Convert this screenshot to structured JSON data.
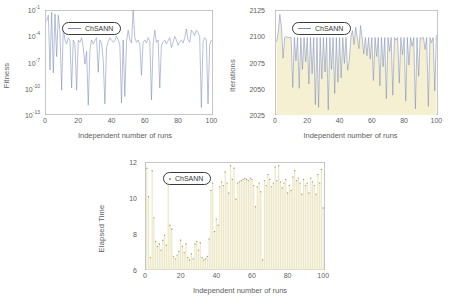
{
  "figure": {
    "series_name": "ChSANN",
    "shared_xlabel": "Independent number of runs",
    "colors": {
      "line": "#7b8cba",
      "fill": "#f5f0d2",
      "stem": "#ece7c4",
      "marker": "#9a9a76",
      "frame": "#b8b8b8",
      "text": "#5e5e5e",
      "legend_border": "#3a3a3a"
    }
  },
  "panels": {
    "fitness": {
      "name": "Fitness vs independent runs",
      "legend_label": "ChSANN",
      "legend_marker": "line-marker",
      "ylabel": "Fitness",
      "xlabel": "Independent number of runs",
      "yticks": [
        "10",
        "10",
        "10",
        "10",
        "10"
      ],
      "ytick_exponents": [
        "-1",
        "-4",
        "-7",
        "-10",
        "-13"
      ],
      "xticks": [
        "0",
        "20",
        "40",
        "60",
        "80",
        "100"
      ]
    },
    "iterations": {
      "name": "Iterations vs independent runs",
      "legend_label": "ChSANN",
      "legend_marker": "line-marker",
      "ylabel": "Iterations",
      "xlabel": "Independent number of runs",
      "yticks": [
        "2125",
        "2100",
        "2075",
        "2050",
        "2025"
      ],
      "xticks": [
        "0",
        "20",
        "40",
        "60",
        "80",
        "100"
      ]
    },
    "elapsed": {
      "name": "Elapsed time vs independent runs",
      "legend_label": "ChSANN",
      "legend_marker": "dot-marker",
      "ylabel": "Elapsed Time",
      "xlabel": "Independent number of runs",
      "yticks": [
        "12",
        "10",
        "8",
        "6"
      ],
      "xticks": [
        "0",
        "20",
        "40",
        "60",
        "80",
        "100"
      ]
    }
  },
  "chart_data": [
    {
      "type": "line",
      "id": "fitness",
      "title": "",
      "xlabel": "Independent number of runs",
      "ylabel": "Fitness",
      "yscale": "log",
      "ylim": [
        1e-14,
        1.0
      ],
      "xlim": [
        0,
        101
      ],
      "grid": false,
      "legend": [
        "ChSANN"
      ],
      "legend_position": "upper-left-inside",
      "series": [
        {
          "name": "ChSANN",
          "x": [
            1,
            2,
            3,
            4,
            5,
            6,
            7,
            8,
            9,
            10,
            11,
            12,
            13,
            14,
            15,
            16,
            17,
            18,
            19,
            20,
            21,
            22,
            23,
            24,
            25,
            26,
            27,
            28,
            29,
            30,
            31,
            32,
            33,
            34,
            35,
            36,
            37,
            38,
            39,
            40,
            41,
            42,
            43,
            44,
            45,
            46,
            47,
            48,
            49,
            50,
            51,
            52,
            53,
            54,
            55,
            56,
            57,
            58,
            59,
            60,
            61,
            62,
            63,
            64,
            65,
            66,
            67,
            68,
            69,
            70,
            71,
            72,
            73,
            74,
            75,
            76,
            77,
            78,
            79,
            80,
            81,
            82,
            83,
            84,
            85,
            86,
            87,
            88,
            89,
            90,
            91,
            92,
            93,
            94,
            95,
            96,
            97,
            98,
            99,
            100
          ],
          "values": [
            0.03,
            0.2,
            1e-08,
            0.5,
            4e-09,
            0.3,
            6e-07,
            0.2,
            0.001,
            2e-11,
            0.005,
            0.0001,
            3e-05,
            0.0002,
            8e-05,
            4e-11,
            0.0001,
            3e-05,
            2e-11,
            0.0001,
            5e-05,
            0.0002,
            1e-05,
            6e-08,
            3e-06,
            2e-13,
            4e-06,
            0.0001,
            3e-05,
            8e-05,
            0.0002,
            5e-09,
            0.0001,
            4e-05,
            2e-07,
            3e-13,
            1e-05,
            6e-05,
            0.0002,
            0.0001,
            5e-05,
            8e-05,
            0.0003,
            0.0001,
            2e-05,
            4e-13,
            0.0001,
            3e-12,
            6e-05,
            0.002,
            0.0001,
            4e-05,
            0.9,
            0.0002,
            5e-05,
            0.0001,
            3e-05,
            2e-09,
            6e-05,
            0.0001,
            4e-05,
            0.0002,
            8e-05,
            1e-12,
            3e-05,
            0.002,
            5e-05,
            0.0001,
            4e-11,
            2e-05,
            6e-05,
            0.0001,
            3e-05,
            8e-05,
            0.0002,
            1e-05,
            5e-05,
            0.0003,
            0.0001,
            2e-05,
            6e-05,
            0.0001,
            4e-05,
            0.0002,
            0.003,
            0.0001,
            5e-05,
            0.002,
            0.001,
            0.0004,
            0.002,
            0.001,
            0.0003,
            1e-13,
            5e-05,
            0.0002,
            0.0001,
            3e-13,
            2e-05,
            0.0001
          ]
        }
      ]
    },
    {
      "type": "area",
      "id": "iterations",
      "title": "",
      "xlabel": "Independent number of runs",
      "ylabel": "Iterations",
      "yscale": "linear",
      "ylim": [
        2010,
        2132
      ],
      "xlim": [
        0,
        101
      ],
      "grid": false,
      "legend": [
        "ChSANN"
      ],
      "legend_position": "upper-left-inside",
      "series": [
        {
          "name": "ChSANN",
          "x": [
            1,
            2,
            3,
            4,
            5,
            6,
            7,
            8,
            9,
            10,
            11,
            12,
            13,
            14,
            15,
            16,
            17,
            18,
            19,
            20,
            21,
            22,
            23,
            24,
            25,
            26,
            27,
            28,
            29,
            30,
            31,
            32,
            33,
            34,
            35,
            36,
            37,
            38,
            39,
            40,
            41,
            42,
            43,
            44,
            45,
            46,
            47,
            48,
            49,
            50,
            51,
            52,
            53,
            54,
            55,
            56,
            57,
            58,
            59,
            60,
            61,
            62,
            63,
            64,
            65,
            66,
            67,
            68,
            69,
            70,
            71,
            72,
            73,
            74,
            75,
            76,
            77,
            78,
            79,
            80,
            81,
            82,
            83,
            84,
            85,
            86,
            87,
            88,
            89,
            90,
            91,
            92,
            93,
            94,
            95,
            96,
            97,
            98,
            99,
            100
          ],
          "values": [
            2095,
            2106,
            2127,
            2112,
            2076,
            2100,
            2101,
            2100,
            2100,
            2100,
            2042,
            2100,
            2073,
            2100,
            2041,
            2100,
            2063,
            2100,
            2072,
            2100,
            2046,
            2100,
            2058,
            2100,
            2022,
            2100,
            2019,
            2100,
            2052,
            2100,
            2060,
            2100,
            2016,
            2100,
            2063,
            2100,
            2035,
            2100,
            2048,
            2100,
            2053,
            2100,
            2070,
            2100,
            2062,
            2073,
            2100,
            2108,
            2092,
            2112,
            2100,
            2087,
            2114,
            2100,
            2081,
            2100,
            2079,
            2100,
            2075,
            2100,
            2050,
            2100,
            2078,
            2100,
            2044,
            2100,
            2066,
            2100,
            2029,
            2100,
            2084,
            2100,
            2033,
            2100,
            2097,
            2100,
            2047,
            2100,
            2080,
            2100,
            2026,
            2100,
            2068,
            2100,
            2090,
            2100,
            2017,
            2100,
            2055,
            2100,
            2099,
            2100,
            2086,
            2100,
            2020,
            2100,
            2094,
            2100,
            2038,
            2103
          ]
        }
      ]
    },
    {
      "type": "bar",
      "id": "elapsed",
      "title": "",
      "xlabel": "Independent number of runs",
      "ylabel": "Elapsed Time",
      "yscale": "linear",
      "ylim": [
        4.2,
        12.9
      ],
      "xlim": [
        0,
        101
      ],
      "grid": false,
      "legend": [
        "ChSANN"
      ],
      "legend_position": "upper-left-inside",
      "series": [
        {
          "name": "ChSANN",
          "x": [
            1,
            2,
            3,
            4,
            5,
            6,
            7,
            8,
            9,
            10,
            11,
            12,
            13,
            14,
            15,
            16,
            17,
            18,
            19,
            20,
            21,
            22,
            23,
            24,
            25,
            26,
            27,
            28,
            29,
            30,
            31,
            32,
            33,
            34,
            35,
            36,
            37,
            38,
            39,
            40,
            41,
            42,
            43,
            44,
            45,
            46,
            47,
            48,
            49,
            50,
            51,
            52,
            53,
            54,
            55,
            56,
            57,
            58,
            59,
            60,
            61,
            62,
            63,
            64,
            65,
            66,
            67,
            68,
            69,
            70,
            71,
            72,
            73,
            74,
            75,
            76,
            77,
            78,
            79,
            80,
            81,
            82,
            83,
            84,
            85,
            86,
            87,
            88,
            89,
            90,
            91,
            92,
            93,
            94,
            95,
            96,
            97,
            98,
            99,
            100
          ],
          "values": [
            12.4,
            10.1,
            5.2,
            12.2,
            8.4,
            6.5,
            6.1,
            6.3,
            5.8,
            6.6,
            7.0,
            6.2,
            11.9,
            7.8,
            7.5,
            5.3,
            5.1,
            5.4,
            5.7,
            6.6,
            6.1,
            5.6,
            6.3,
            5.2,
            5.0,
            5.5,
            5.1,
            6.3,
            6.5,
            5.8,
            6.4,
            5.2,
            5.0,
            5.1,
            5.3,
            6.7,
            10.6,
            11.2,
            7.3,
            8.3,
            7.8,
            10.9,
            11.3,
            11.0,
            12.1,
            11.2,
            10.4,
            12.6,
            11.5,
            12.4,
            9.9,
            11.2,
            11.3,
            11.4,
            11.5,
            11.6,
            11.5,
            11.4,
            11.6,
            11.5,
            11.0,
            9.3,
            10.9,
            11.2,
            10.5,
            5.0,
            11.4,
            11.0,
            11.9,
            11.5,
            10.9,
            11.2,
            12.5,
            11.4,
            12.6,
            11.3,
            10.8,
            11.2,
            11.5,
            10.4,
            11.0,
            10.6,
            11.7,
            12.2,
            11.4,
            11.6,
            11.2,
            10.3,
            11.5,
            11.0,
            11.2,
            10.4,
            11.6,
            11.3,
            11.0,
            10.3,
            11.9,
            11.2,
            12.3,
            9.2
          ]
        }
      ]
    }
  ]
}
